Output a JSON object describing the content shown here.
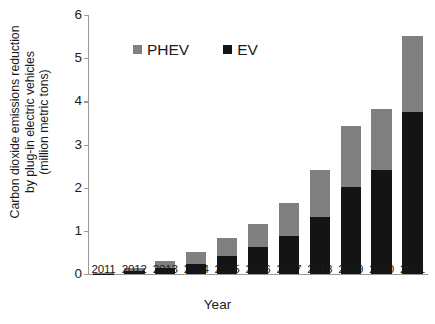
{
  "chart_data": {
    "type": "bar",
    "subtype": "stacked-bar",
    "title": "",
    "xlabel": "Year",
    "ylabel": "Carbon dioxide emissions reduction by plug-in electric vehicles (million metric tons)",
    "ylabel_lines": [
      "Carbon dioxide emissions reduction",
      "by plug-in electric vehicles",
      "(million metric tons)"
    ],
    "categories": [
      "2011",
      "2012",
      "2013",
      "2014",
      "2015",
      "2016",
      "2017",
      "2018",
      "2019",
      "2020",
      "2021"
    ],
    "series": [
      {
        "name": "EV",
        "color": "#141414",
        "values": [
          0.01,
          0.06,
          0.15,
          0.24,
          0.42,
          0.62,
          0.87,
          1.31,
          2.01,
          2.41,
          3.75
        ]
      },
      {
        "name": "PHEV",
        "color": "#808080",
        "values": [
          0.01,
          0.07,
          0.16,
          0.26,
          0.41,
          0.54,
          0.77,
          1.1,
          1.41,
          1.41,
          1.76
        ]
      }
    ],
    "totals": [
      0.02,
      0.13,
      0.31,
      0.5,
      0.83,
      1.16,
      1.64,
      2.41,
      3.42,
      3.82,
      5.51
    ],
    "ylim": [
      0,
      6
    ],
    "yticks": [
      0,
      1,
      2,
      3,
      4,
      5,
      6
    ],
    "ytick_labels": [
      "0",
      "1",
      "2",
      "3",
      "4",
      "5",
      "6"
    ],
    "grid": false,
    "legend_position": "upper-left-inside",
    "legend": [
      {
        "label": "PHEV",
        "color": "#808080"
      },
      {
        "label": "EV",
        "color": "#141414"
      }
    ],
    "axis_color": "#9a9a9a"
  }
}
